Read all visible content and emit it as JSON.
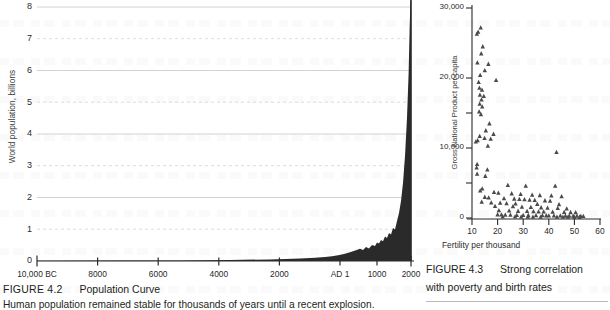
{
  "page": {
    "background": "#ffffff",
    "ink": "#231f20",
    "grid_solid_color": "#d2d2d4",
    "grid_dashed_color": "#dcdcde",
    "curve_fill": "#2a2a2a",
    "marker_color": "#4a4a4a"
  },
  "figure_population": {
    "caption_number": "FIGURE 4.2",
    "caption_title": "Population Curve",
    "caption_subtitle": "Human population remained stable for thousands of years until a recent explosion.",
    "y_axis_label": "World population, billions",
    "y_ticks": [
      "8",
      "7",
      "6",
      "5",
      "4",
      "3",
      "2",
      "1",
      "0"
    ],
    "x_ticks": [
      "10,000 BC",
      "8000",
      "6000",
      "4000",
      "2000",
      "AD 1",
      "1000",
      "2000"
    ]
  },
  "figure_gnp": {
    "caption_number": "FIGURE 4.3",
    "caption_line1": "Strong correlation",
    "caption_line2": "with poverty and birth rates",
    "y_axis_label": "Gross National Product per capita",
    "x_axis_label": "Fertility per thousand",
    "y_ticks": [
      "30,000",
      "20,000",
      "10,000",
      "0"
    ],
    "x_ticks": [
      "10",
      "20",
      "30",
      "40",
      "50",
      "60"
    ]
  },
  "chart_data": [
    {
      "type": "area",
      "id": "population-curve",
      "title": "Population Curve",
      "xlabel": "",
      "ylabel": "World population, billions",
      "ylim": [
        0,
        8
      ],
      "ytick_values": [
        0,
        1,
        2,
        3,
        4,
        5,
        6,
        7,
        8
      ],
      "grid": "horizontal-only; solid at even values, dashed at odd values",
      "xtick_labels": [
        "10,000 BC",
        "8000",
        "6000",
        "4000",
        "2000",
        "AD 1",
        "1000",
        "2000"
      ],
      "xtick_years": [
        -10000,
        -8000,
        -6000,
        -4000,
        -2000,
        1,
        1000,
        2000
      ],
      "x_note": "Axis is linear from 10,000 BC to AD 1, then compressed for AD 1 to AD 2000",
      "x": [
        -10000,
        -9000,
        -8000,
        -7000,
        -6000,
        -5000,
        -4000,
        -3000,
        -2000,
        -1000,
        -500,
        1,
        500,
        1000,
        1200,
        1400,
        1500,
        1600,
        1700,
        1750,
        1800,
        1850,
        1900,
        1927,
        1950,
        1960,
        1974,
        1987,
        1999,
        2000
      ],
      "values": [
        0.004,
        0.005,
        0.005,
        0.007,
        0.01,
        0.015,
        0.02,
        0.03,
        0.05,
        0.1,
        0.15,
        0.2,
        0.21,
        0.31,
        0.4,
        0.35,
        0.46,
        0.58,
        0.68,
        0.79,
        0.98,
        1.26,
        1.65,
        2.0,
        2.55,
        3.0,
        4.0,
        5.0,
        6.0,
        6.1
      ]
    },
    {
      "type": "scatter",
      "id": "gnp-vs-fertility",
      "title": "Strong correlation with poverty and birth rates",
      "xlabel": "Fertility per thousand",
      "ylabel": "Gross National Product per capita",
      "xlim": [
        8,
        60
      ],
      "ylim": [
        0,
        30000
      ],
      "xtick_values": [
        10,
        20,
        30,
        40,
        50,
        60
      ],
      "ytick_values": [
        0,
        10000,
        20000,
        30000
      ],
      "marker": "triangle-up",
      "grid": false,
      "points": [
        [
          12.4,
          26600
        ],
        [
          13.4,
          27200
        ],
        [
          11.9,
          26300
        ],
        [
          14.2,
          24500
        ],
        [
          13.6,
          23500
        ],
        [
          12.1,
          22200
        ],
        [
          16.4,
          22000
        ],
        [
          15.0,
          21100
        ],
        [
          13.2,
          20400
        ],
        [
          19.4,
          19700
        ],
        [
          12.6,
          19400
        ],
        [
          12.9,
          18600
        ],
        [
          13.9,
          18300
        ],
        [
          13.1,
          17600
        ],
        [
          14.6,
          17400
        ],
        [
          13.7,
          16900
        ],
        [
          13.0,
          16300
        ],
        [
          14.0,
          15900
        ],
        [
          12.8,
          15200
        ],
        [
          13.5,
          14800
        ],
        [
          16.8,
          13500
        ],
        [
          15.4,
          12500
        ],
        [
          13.0,
          11700
        ],
        [
          14.9,
          11400
        ],
        [
          17.3,
          11300
        ],
        [
          18.4,
          12000
        ],
        [
          12.2,
          11100
        ],
        [
          11.5,
          10900
        ],
        [
          16.2,
          10300
        ],
        [
          43.0,
          9400
        ],
        [
          12.0,
          7700
        ],
        [
          11.8,
          7200
        ],
        [
          16.0,
          6900
        ],
        [
          12.0,
          6300
        ],
        [
          15.2,
          6000
        ],
        [
          24.0,
          4700
        ],
        [
          31.0,
          4600
        ],
        [
          42.5,
          4600
        ],
        [
          14.0,
          4200
        ],
        [
          13.2,
          3900
        ],
        [
          18.6,
          3700
        ],
        [
          20.3,
          3600
        ],
        [
          25.5,
          3500
        ],
        [
          29.0,
          3400
        ],
        [
          33.5,
          3300
        ],
        [
          36.5,
          3250
        ],
        [
          41.0,
          3200
        ],
        [
          45.0,
          3100
        ],
        [
          15.0,
          3000
        ],
        [
          16.5,
          2900
        ],
        [
          22.5,
          2800
        ],
        [
          26.5,
          2750
        ],
        [
          28.5,
          2700
        ],
        [
          30.5,
          2650
        ],
        [
          32.5,
          2600
        ],
        [
          34.5,
          2550
        ],
        [
          38.5,
          2500
        ],
        [
          40.5,
          2450
        ],
        [
          13.8,
          2300
        ],
        [
          17.5,
          2200
        ],
        [
          21.0,
          2150
        ],
        [
          23.5,
          2100
        ],
        [
          27.0,
          2050
        ],
        [
          35.5,
          2000
        ],
        [
          44.0,
          1950
        ],
        [
          19.0,
          1700
        ],
        [
          26.0,
          1650
        ],
        [
          29.5,
          1600
        ],
        [
          33.0,
          1550
        ],
        [
          37.0,
          1500
        ],
        [
          39.5,
          1450
        ],
        [
          43.5,
          1400
        ],
        [
          47.0,
          1350
        ],
        [
          20.5,
          1100
        ],
        [
          24.5,
          1050
        ],
        [
          28.0,
          1000
        ],
        [
          31.5,
          980
        ],
        [
          34.0,
          950
        ],
        [
          36.0,
          920
        ],
        [
          38.0,
          900
        ],
        [
          41.5,
          880
        ],
        [
          46.0,
          850
        ],
        [
          48.5,
          820
        ],
        [
          50.5,
          800
        ],
        [
          20.0,
          500
        ],
        [
          21.5,
          480
        ],
        [
          23.0,
          460
        ],
        [
          25.0,
          440
        ],
        [
          27.5,
          420
        ],
        [
          30.0,
          400
        ],
        [
          32.0,
          390
        ],
        [
          35.0,
          380
        ],
        [
          37.5,
          370
        ],
        [
          39.0,
          360
        ],
        [
          40.0,
          350
        ],
        [
          42.0,
          340
        ],
        [
          44.5,
          330
        ],
        [
          46.5,
          320
        ],
        [
          48.0,
          310
        ],
        [
          49.5,
          300
        ],
        [
          51.0,
          290
        ],
        [
          52.5,
          280
        ],
        [
          53.5,
          270
        ],
        [
          22.0,
          200
        ],
        [
          26.8,
          190
        ],
        [
          29.2,
          180
        ],
        [
          31.8,
          175
        ],
        [
          33.8,
          170
        ],
        [
          36.8,
          165
        ],
        [
          43.2,
          160
        ],
        [
          45.5,
          155
        ],
        [
          47.5,
          150
        ],
        [
          50.0,
          145
        ],
        [
          52.0,
          140
        ]
      ]
    }
  ]
}
